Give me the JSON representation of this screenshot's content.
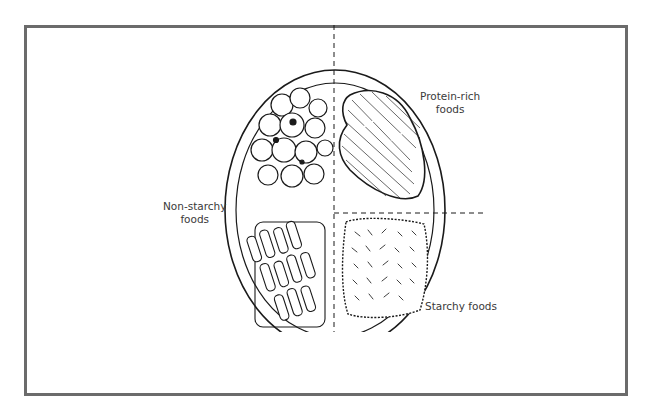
{
  "diagram": {
    "type": "plate-method-diagram",
    "labels": {
      "protein": {
        "line1": "Protein-rich",
        "line2": "foods"
      },
      "non_starchy": {
        "line1": "Non-starchy",
        "line2": "foods"
      },
      "starchy": {
        "line1": "Starchy foods"
      }
    },
    "sections": [
      {
        "name": "non-starchy-foods",
        "position": "left half",
        "depicts": "broccoli and carrots"
      },
      {
        "name": "protein-rich-foods",
        "position": "upper-right quarter",
        "depicts": "meat"
      },
      {
        "name": "starchy-foods",
        "position": "lower-right quarter",
        "depicts": "rice"
      }
    ],
    "colors": {
      "frame": "#6b6b6b",
      "ink": "#1a1a1a",
      "label": "#3a3a3a",
      "background": "#ffffff"
    }
  }
}
